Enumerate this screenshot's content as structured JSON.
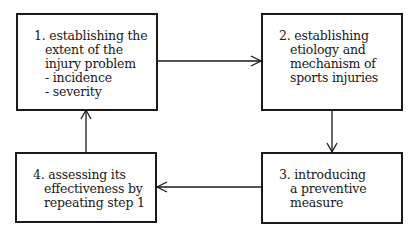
{
  "diagram": {
    "type": "cycle-flow",
    "steps": [
      {
        "number": "1.",
        "lines": [
          "establishing the",
          "extent of the",
          "injury problem",
          "- incidence",
          "- severity"
        ]
      },
      {
        "number": "2.",
        "lines": [
          "establishing",
          "etiology and",
          "mechanism of",
          "sports injuries"
        ]
      },
      {
        "number": "3.",
        "lines": [
          "introducing",
          "a preventive",
          "measure"
        ]
      },
      {
        "number": "4.",
        "lines": [
          "assessing its",
          "effectiveness by",
          "repeating step 1"
        ]
      }
    ],
    "edges": [
      {
        "from": 1,
        "to": 2,
        "direction": "right"
      },
      {
        "from": 2,
        "to": 3,
        "direction": "down"
      },
      {
        "from": 3,
        "to": 4,
        "direction": "left"
      },
      {
        "from": 4,
        "to": 1,
        "direction": "up"
      }
    ],
    "colors": {
      "stroke": "#1a1a1a",
      "background": "#ffffff"
    }
  }
}
